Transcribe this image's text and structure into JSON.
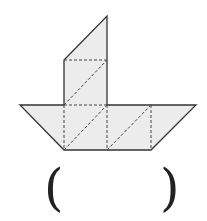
{
  "figure": {
    "fill": "#ececec",
    "stroke": "#333333",
    "answer_open": "(",
    "answer_close": ")",
    "answer_value": ""
  }
}
